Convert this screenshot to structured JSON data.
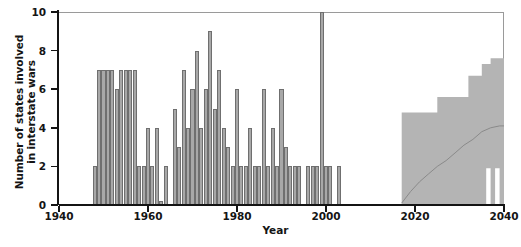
{
  "chart_data": {
    "type": "bar",
    "title": "",
    "xlabel": "Year",
    "ylabel_line1": "Number of states involved",
    "ylabel_line2": "in interstate wars",
    "ylabel": "Number of states involved in interstate wars",
    "xlim": [
      1940,
      2040
    ],
    "ylim": [
      0,
      10
    ],
    "xticks": [
      1940,
      1960,
      1980,
      2000,
      2020,
      2040
    ],
    "xtick_labels": [
      "1940",
      "1960",
      "1980",
      "2000",
      "2020",
      "2040"
    ],
    "yticks": [
      0,
      2,
      4,
      6,
      8,
      10
    ],
    "ytick_labels": [
      "0",
      "2",
      "4",
      "6",
      "8",
      "10"
    ],
    "grid": false,
    "legend": "none",
    "bar_color": "#a8a8a8",
    "bar_edge_color": "#6f6f6f",
    "band_color": "#b4b4b4",
    "median_line_color": "#8a8a8a",
    "axis_color": "#141414",
    "series": [
      {
        "name": "States involved in interstate wars (historical)",
        "x": [
          1948,
          1949,
          1950,
          1951,
          1952,
          1953,
          1954,
          1955,
          1956,
          1957,
          1958,
          1959,
          1960,
          1961,
          1962,
          1963,
          1964,
          1965,
          1966,
          1967,
          1968,
          1969,
          1970,
          1971,
          1972,
          1973,
          1974,
          1975,
          1976,
          1977,
          1978,
          1979,
          1980,
          1981,
          1982,
          1983,
          1984,
          1985,
          1986,
          1987,
          1988,
          1989,
          1990,
          1991,
          1992,
          1993,
          1994,
          1995,
          1996,
          1997,
          1998,
          1999,
          2000,
          2001,
          2002,
          2003
        ],
        "values": [
          2,
          7,
          7,
          7,
          7,
          6,
          7,
          7,
          7,
          7,
          2,
          2,
          4,
          2,
          4,
          0.2,
          2,
          0,
          5,
          3,
          7,
          4,
          6,
          8,
          4,
          6,
          9,
          5,
          7,
          4,
          3,
          2,
          6,
          2,
          2,
          4,
          2,
          2,
          6,
          2,
          4,
          2,
          6,
          3,
          2,
          2,
          2,
          0,
          2,
          2,
          2,
          10,
          2,
          2,
          0,
          2
        ],
        "note": "Annual counts read from bar heights; 1999 bar reaches the top of the axis at 10"
      },
      {
        "name": "Projection median",
        "type": "line",
        "x": [
          2017,
          2019,
          2021,
          2023,
          2025,
          2027,
          2029,
          2031,
          2033,
          2035,
          2037,
          2039,
          2040
        ],
        "values": [
          0.1,
          0.7,
          1.2,
          1.6,
          2.0,
          2.3,
          2.7,
          3.1,
          3.4,
          3.8,
          4.0,
          4.1,
          4.1
        ]
      },
      {
        "name": "Projection uncertainty band (upper)",
        "type": "step",
        "x": [
          2017,
          2021,
          2025,
          2029,
          2032,
          2035,
          2037,
          2040
        ],
        "values": [
          4.8,
          4.8,
          5.6,
          5.6,
          6.7,
          7.3,
          7.6,
          7.6
        ]
      },
      {
        "name": "Projection uncertainty band (lower)",
        "type": "step",
        "x": [
          2017,
          2024,
          2025,
          2034,
          2035,
          2036,
          2037,
          2038,
          2039,
          2040
        ],
        "values": [
          0.0,
          0.0,
          0.0,
          0.0,
          0.0,
          1.9,
          0.0,
          1.9,
          0.0,
          0.0
        ],
        "note": "Lower bound sits on zero with narrow notches near 2036 and 2038"
      }
    ]
  }
}
